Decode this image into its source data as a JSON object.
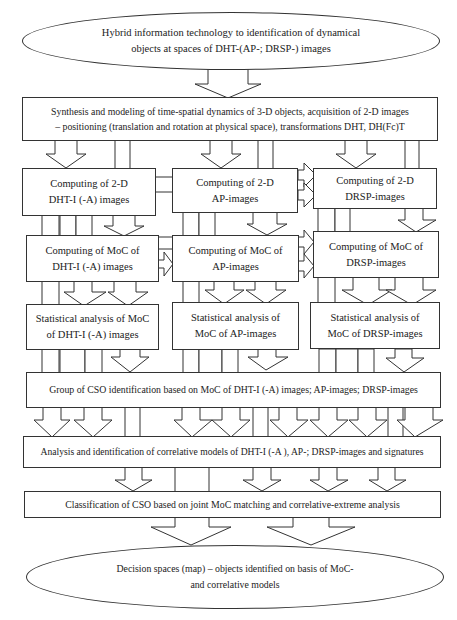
{
  "diagram": {
    "top_ellipse": {
      "line1": "Hybrid information technology to identification of dynamical",
      "line2": "objects at spaces of DHT-(AP-; DRSP-) images"
    },
    "synthesis_box": {
      "line1": "Synthesis and modeling of time-spatial dynamics of 3-D objects, acquisition of 2-D images",
      "line2": "– positioning (translation and rotation at physical space), transformations DHT, DH(Fc)T"
    },
    "computing_2d": [
      {
        "line1": "Computing of 2-D",
        "line2": "DHT-I (-A) images"
      },
      {
        "line1": "Computing of 2-D",
        "line2": "AP-images"
      },
      {
        "line1": "Computing of 2-D",
        "line2": "DRSP-images"
      }
    ],
    "computing_moc": [
      {
        "line1": "Computing of MoC of",
        "line2": "DHT-I (-A) images"
      },
      {
        "line1": "Computing of MoC of",
        "line2": "AP-images"
      },
      {
        "line1": "Computing of MoC of",
        "line2": "DRSP-images"
      }
    ],
    "statistical": [
      {
        "line1": "Statistical analysis of MoC",
        "line2": "of DHT-I (-A) images"
      },
      {
        "line1": "Statistical analysis of",
        "line2": "MoC of AP-images"
      },
      {
        "line1": "Statistical analysis of",
        "line2": "MoC of DRSP-images"
      }
    ],
    "group_box": "Group of CSO identification based on MoC of DHT-I (-A) images; AP-images; DRSP-images",
    "analysis_box": "Analysis and identification of correlative models of DHT-I (-A ), AP-; DRSP-images and signatures",
    "classification_box": "Classification of CSO based on joint MoC matching and correlative-extreme analysis",
    "bottom_ellipse": {
      "line1": "Decision spaces (map) – objects identified on basis of MoC-",
      "line2": "and correlative models"
    }
  }
}
